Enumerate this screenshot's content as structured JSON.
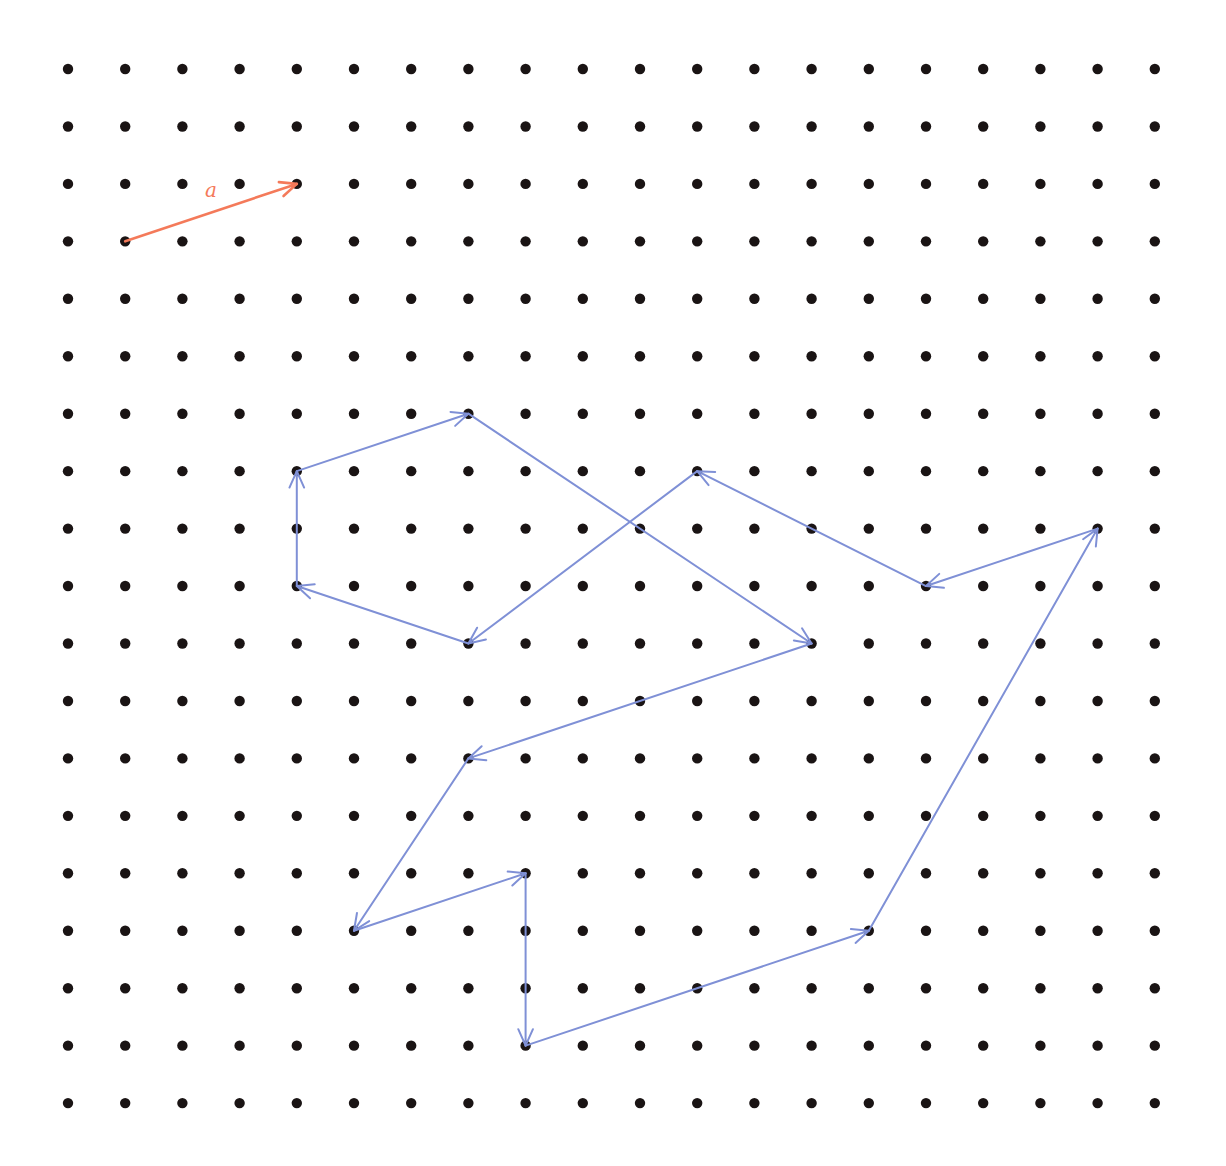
{
  "grid": {
    "columns": 20,
    "rows": 19,
    "origin_x": 68,
    "origin_y": 69,
    "spacing_x": 57.2,
    "spacing_y": 57.45,
    "dot_radius": 5.2,
    "dot_color": "#1a1414"
  },
  "reference_vector": {
    "label": "a",
    "color": "#f47a5a",
    "from": [
      1,
      3
    ],
    "to": [
      4,
      2
    ],
    "label_pos": [
      211,
      197
    ]
  },
  "path": {
    "color": "#7f90d6",
    "segments": [
      {
        "from": [
          7,
          6
        ],
        "to": [
          13,
          10
        ]
      },
      {
        "from": [
          13,
          10
        ],
        "to": [
          7,
          12
        ]
      },
      {
        "from": [
          7,
          12
        ],
        "to": [
          5,
          15
        ]
      },
      {
        "from": [
          5,
          15
        ],
        "to": [
          8,
          14
        ]
      },
      {
        "from": [
          8,
          14
        ],
        "to": [
          8,
          17
        ]
      },
      {
        "from": [
          8,
          17
        ],
        "to": [
          14,
          15
        ]
      },
      {
        "from": [
          14,
          15
        ],
        "to": [
          18,
          8
        ]
      },
      {
        "from": [
          18,
          8
        ],
        "to": [
          15,
          9
        ]
      },
      {
        "from": [
          15,
          9
        ],
        "to": [
          11,
          7
        ]
      },
      {
        "from": [
          11,
          7
        ],
        "to": [
          7,
          10
        ]
      },
      {
        "from": [
          7,
          10
        ],
        "to": [
          4,
          9
        ]
      },
      {
        "from": [
          4,
          9
        ],
        "to": [
          4,
          7
        ]
      },
      {
        "from": [
          4,
          7
        ],
        "to": [
          7,
          6
        ]
      }
    ]
  }
}
